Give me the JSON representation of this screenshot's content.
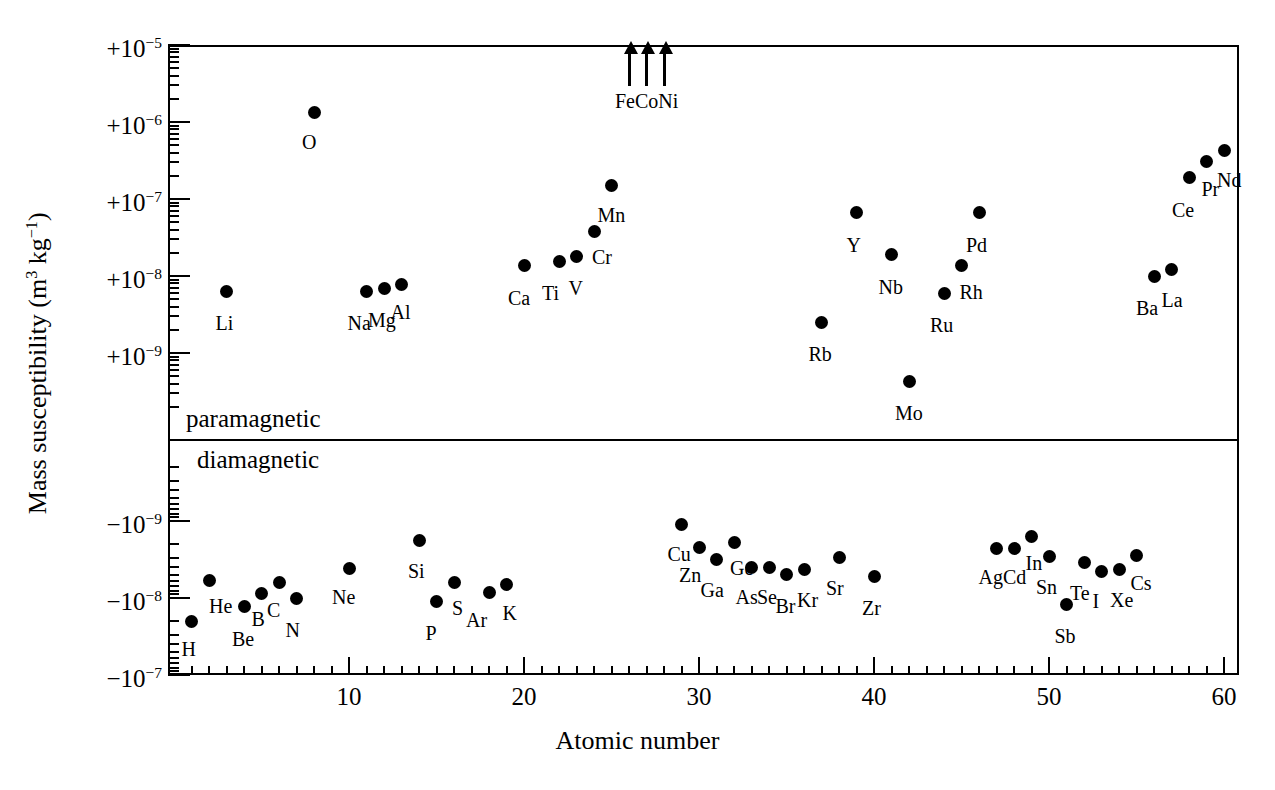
{
  "chart_data": {
    "type": "scatter",
    "title": "",
    "xlabel": "Atomic number",
    "ylabel": "Mass susceptibility (m3 kg-1)",
    "ylabel_parts": {
      "prefix": "Mass susceptibility (m",
      "sup1": "3",
      "mid": " kg",
      "sup2": "−1",
      "suffix": ")"
    },
    "xlim": [
      1,
      61
    ],
    "xticks_major": [
      10,
      20,
      30,
      40,
      50,
      60
    ],
    "xticks_major_labels": [
      "10",
      "20",
      "30",
      "40",
      "50",
      "60"
    ],
    "yaxis_type": "split-symlog",
    "yticks_upper": [
      "+10-5",
      "+10-6",
      "+10-7",
      "+10-8",
      "+10-9"
    ],
    "yticks_upper_labels": [
      {
        "sign": "+10",
        "exp": "−5"
      },
      {
        "sign": "+10",
        "exp": "−6"
      },
      {
        "sign": "+10",
        "exp": "−7"
      },
      {
        "sign": "+10",
        "exp": "−8"
      },
      {
        "sign": "+10",
        "exp": "−9"
      }
    ],
    "yticks_lower_labels": [
      {
        "sign": "−10",
        "exp": "−9"
      },
      {
        "sign": "−10",
        "exp": "−8"
      },
      {
        "sign": "−10",
        "exp": "−7"
      }
    ],
    "regions": [
      {
        "name": "paramagnetic",
        "label": "paramagnetic"
      },
      {
        "name": "diamagnetic",
        "label": "diamagnetic"
      }
    ],
    "ferromagnetic": {
      "note": "off-scale ferromagnetic elements marked with up arrows",
      "elements": [
        {
          "label": "Fe",
          "z": 26
        },
        {
          "label": "Co",
          "z": 27
        },
        {
          "label": "Ni",
          "z": 28
        }
      ]
    },
    "legend": "",
    "grid": false,
    "points": [
      {
        "label": "H",
        "z": 1,
        "value": -2e-08,
        "lab_dx": -2,
        "lab_dy": 22
      },
      {
        "label": "He",
        "z": 2,
        "value": -5.9e-09,
        "lab_dx": 8,
        "lab_dy": 20
      },
      {
        "label": "Li",
        "z": 3,
        "value": 6.3e-09,
        "lab_dx": -3,
        "lab_dy": 26
      },
      {
        "label": "Be",
        "z": 4,
        "value": -1.3e-08,
        "lab_dx": -4,
        "lab_dy": 26
      },
      {
        "label": "B",
        "z": 5,
        "value": -8.7e-09,
        "lab_dx": -2,
        "lab_dy": 20
      },
      {
        "label": "C",
        "z": 6,
        "value": -6.2e-09,
        "lab_dx": -4,
        "lab_dy": 22
      },
      {
        "label": "N",
        "z": 7,
        "value": -1e-08,
        "lab_dx": -3,
        "lab_dy": 26
      },
      {
        "label": "O",
        "z": 8,
        "value": 1.33e-06,
        "lab_dx": -4,
        "lab_dy": 24
      },
      {
        "label": "Ne",
        "z": 10,
        "value": -4.2e-09,
        "lab_dx": -9,
        "lab_dy": 22
      },
      {
        "label": "Na",
        "z": 11,
        "value": 6.3e-09,
        "lab_dx": -11,
        "lab_dy": 26
      },
      {
        "label": "Mg",
        "z": 12,
        "value": 6.8e-09,
        "lab_dx": -8,
        "lab_dy": 25
      },
      {
        "label": "Al",
        "z": 13,
        "value": 7.8e-09,
        "lab_dx": -3,
        "lab_dy": 22
      },
      {
        "label": "Si",
        "z": 14,
        "value": -1.8e-09,
        "lab_dx": -3,
        "lab_dy": 24
      },
      {
        "label": "P",
        "z": 15,
        "value": -1.1e-08,
        "lab_dx": -3,
        "lab_dy": 26
      },
      {
        "label": "S",
        "z": 16,
        "value": -6.2e-09,
        "lab_dx": 6,
        "lab_dy": 20
      },
      {
        "label": "Ar",
        "z": 18,
        "value": -8.4e-09,
        "lab_dx": -15,
        "lab_dy": 22
      },
      {
        "label": "K",
        "z": 19,
        "value": -6.7e-09,
        "lab_dx": 4,
        "lab_dy": 22
      },
      {
        "label": "Ca",
        "z": 20,
        "value": 1.35e-08,
        "lab_dx": -8,
        "lab_dy": 26
      },
      {
        "label": "Ti",
        "z": 22,
        "value": 1.55e-08,
        "lab_dx": -9,
        "lab_dy": 26
      },
      {
        "label": "V",
        "z": 23,
        "value": 1.8e-08,
        "lab_dx": 0,
        "lab_dy": 26
      },
      {
        "label": "Cr",
        "z": 24,
        "value": 3.8e-08,
        "lab_dx": 6,
        "lab_dy": 20
      },
      {
        "label": "Mn",
        "z": 25,
        "value": 1.5e-07,
        "lab_dx": -6,
        "lab_dy": 24
      },
      {
        "label": "Rb",
        "z": 37,
        "value": 2.5e-09,
        "lab_dx": -5,
        "lab_dy": 26
      },
      {
        "label": "Sr",
        "z": 38,
        "value": -3e-09,
        "lab_dx": -5,
        "lab_dy": 24
      },
      {
        "label": "Y",
        "z": 39,
        "value": 6.6e-08,
        "lab_dx": -2,
        "lab_dy": 26
      },
      {
        "label": "Zr",
        "z": 40,
        "value": -5.2e-09,
        "lab_dx": -4,
        "lab_dy": 26
      },
      {
        "label": "Nb",
        "z": 41,
        "value": 1.9e-08,
        "lab_dx": -5,
        "lab_dy": 26
      },
      {
        "label": "Mo",
        "z": 42,
        "value": 4.3e-10,
        "lab_dx": -6,
        "lab_dy": 26
      },
      {
        "label": "Ru",
        "z": 44,
        "value": 6e-09,
        "lab_dx": -6,
        "lab_dy": 26
      },
      {
        "label": "Rh",
        "z": 45,
        "value": 1.35e-08,
        "lab_dx": 6,
        "lab_dy": 20
      },
      {
        "label": "Pd",
        "z": 46,
        "value": 6.6e-08,
        "lab_dx": -5,
        "lab_dy": 26
      },
      {
        "label": "Ag",
        "z": 47,
        "value": -2.3e-09,
        "lab_dx": -10,
        "lab_dy": 22
      },
      {
        "label": "Cd",
        "z": 48,
        "value": -2.3e-09,
        "lab_dx": -3,
        "lab_dy": 22
      },
      {
        "label": "In",
        "z": 49,
        "value": -1.6e-09,
        "lab_dx": 2,
        "lab_dy": 20
      },
      {
        "label": "Sn",
        "z": 50,
        "value": -2.9e-09,
        "lab_dx": -5,
        "lab_dy": 24
      },
      {
        "label": "Sb",
        "z": 51,
        "value": -1.2e-08,
        "lab_dx": -4,
        "lab_dy": 26
      },
      {
        "label": "Te",
        "z": 52,
        "value": -3.5e-09,
        "lab_dx": -6,
        "lab_dy": 24
      },
      {
        "label": "I",
        "z": 53,
        "value": -4.5e-09,
        "lab_dx": -1,
        "lab_dy": 24
      },
      {
        "label": "Xe",
        "z": 54,
        "value": -4.3e-09,
        "lab_dx": -1,
        "lab_dy": 24
      },
      {
        "label": "Cs",
        "z": 55,
        "value": -2.8e-09,
        "lab_dx": 2,
        "lab_dy": 22
      },
      {
        "label": "Ba",
        "z": 56,
        "value": 1e-08,
        "lab_dx": -10,
        "lab_dy": 26
      },
      {
        "label": "La",
        "z": 57,
        "value": 1.2e-08,
        "lab_dx": -2,
        "lab_dy": 24
      },
      {
        "label": "Ce",
        "z": 58,
        "value": 1.9e-07,
        "lab_dx": -9,
        "lab_dy": 26
      },
      {
        "label": "Pr",
        "z": 59,
        "value": 3.1e-07,
        "lab_dx": 3,
        "lab_dy": 22
      },
      {
        "label": "Nd",
        "z": 60,
        "value": 4.3e-07,
        "lab_dx": 1,
        "lab_dy": 24
      },
      {
        "label": "Cu",
        "z": 29,
        "value": -1.1e-09,
        "lab_dx": -6,
        "lab_dy": 24
      },
      {
        "label": "Zn",
        "z": 30,
        "value": -2.2e-09,
        "lab_dx": -12,
        "lab_dy": 22
      },
      {
        "label": "Ga",
        "z": 31,
        "value": -3.2e-09,
        "lab_dx": -8,
        "lab_dy": 24
      },
      {
        "label": "Ge",
        "z": 32,
        "value": -1.9e-09,
        "lab_dx": 4,
        "lab_dy": 20
      },
      {
        "label": "As",
        "z": 33,
        "value": -4e-09,
        "lab_dx": -8,
        "lab_dy": 24
      },
      {
        "label": "Se",
        "z": 34,
        "value": -4e-09,
        "lab_dx": -4,
        "lab_dy": 24
      },
      {
        "label": "Br",
        "z": 35,
        "value": -4.9e-09,
        "lab_dx": -3,
        "lab_dy": 26
      },
      {
        "label": "Kr",
        "z": 36,
        "value": -4.3e-09,
        "lab_dx": 1,
        "lab_dy": 24
      }
    ]
  },
  "axis": {
    "x_title": "Atomic number",
    "y_title_prefix": "Mass susceptibility (m",
    "y_title_sup1": "3",
    "y_title_mid": " kg",
    "y_title_sup2": "−1",
    "y_title_suffix": ")"
  },
  "annotations": {
    "paramagnetic": "paramagnetic",
    "diamagnetic": "diamagnetic",
    "ferro_label": "FeCoNi",
    "ferro_fe": "Fe",
    "ferro_co": "Co",
    "ferro_ni": "Ni"
  },
  "colors": {
    "ink": "#000000",
    "paper": "#ffffff",
    "marker": "#000000"
  }
}
